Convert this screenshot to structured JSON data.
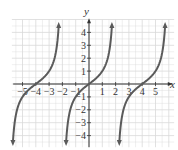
{
  "chart_data": {
    "type": "line",
    "title": "",
    "xlabel": "x",
    "ylabel": "y",
    "function": "y = tan(pi*x/4)",
    "xlim": [
      -5.5,
      5.5
    ],
    "ylim": [
      -4.7,
      4.7
    ],
    "grid": true,
    "x_ticks": [
      -5,
      -4,
      -3,
      -2,
      -1,
      1,
      2,
      3,
      4,
      5
    ],
    "x_tick_labels": [
      "-5",
      "-4",
      "-3",
      "-2",
      "-1",
      "1",
      "2",
      "3",
      "4",
      "5"
    ],
    "y_ticks": [
      -4,
      -3,
      -2,
      -1,
      1,
      2,
      3,
      4
    ],
    "y_tick_labels": [
      "-4",
      "-3",
      "-2",
      "-1",
      "1",
      "2",
      "3",
      "4"
    ],
    "zeros": [
      -4,
      0,
      4
    ],
    "series": [
      {
        "name": "branch-left",
        "x": [
          -5.3,
          -5,
          -4.5,
          -4,
          -3.5,
          -3,
          -2.7
        ],
        "y": [
          -4.5,
          -2.41,
          -0.41,
          0,
          0.41,
          2.41,
          4.5
        ]
      },
      {
        "name": "branch-middle",
        "x": [
          -1.3,
          -1,
          -0.5,
          0,
          0.5,
          1,
          1.3
        ],
        "y": [
          -4.5,
          -1,
          -0.41,
          0,
          0.41,
          1,
          4.5
        ]
      },
      {
        "name": "branch-right",
        "x": [
          2.7,
          3,
          3.5,
          4,
          4.5,
          5,
          5.3
        ],
        "y": [
          -4.5,
          -2.41,
          -0.41,
          0,
          0.41,
          2.41,
          4.5
        ]
      }
    ],
    "colors": {
      "curve": "#5a5a5a",
      "axis": "#333333",
      "grid": "#d9d9d9"
    }
  },
  "labels": {
    "x_axis": "x",
    "y_axis": "y"
  }
}
